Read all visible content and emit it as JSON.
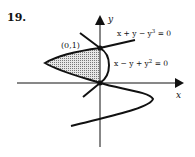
{
  "problem_number": "19.",
  "axes": {
    "x_label": "x",
    "y_label": "y"
  },
  "point_label": "(0,1)",
  "curves": [
    {
      "name": "cubic",
      "equation_parts": [
        "x + y − y",
        "3",
        " = 0"
      ]
    },
    {
      "name": "parabola",
      "equation_parts": [
        "x − y + y",
        "2",
        " = 0"
      ]
    }
  ],
  "shaded_region": "bounded region between curves from y=0 to y=1, left of y-axis",
  "colors": {
    "ink": "#111111",
    "shade": "#bdbdbd"
  }
}
